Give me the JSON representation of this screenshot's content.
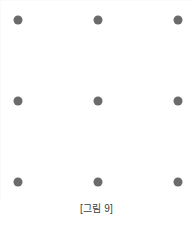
{
  "figure": {
    "caption": "[그림 9]",
    "background_color": "#ffffff",
    "dot_color": "#6b6b6b",
    "caption_color": "#3d3d3d",
    "grid": {
      "rows": 3,
      "columns": 3,
      "dot_diameter_px": 9,
      "column_x": [
        18,
        98,
        178
      ],
      "row_y": [
        20,
        101,
        182
      ],
      "dots": [
        {
          "id": "dot-1",
          "row": 1,
          "col": 1,
          "x": 18,
          "y": 20
        },
        {
          "id": "dot-2",
          "row": 1,
          "col": 2,
          "x": 98,
          "y": 20
        },
        {
          "id": "dot-3",
          "row": 1,
          "col": 3,
          "x": 178,
          "y": 20
        },
        {
          "id": "dot-4",
          "row": 2,
          "col": 1,
          "x": 18,
          "y": 101
        },
        {
          "id": "dot-5",
          "row": 2,
          "col": 2,
          "x": 98,
          "y": 101
        },
        {
          "id": "dot-6",
          "row": 2,
          "col": 3,
          "x": 178,
          "y": 101
        },
        {
          "id": "dot-7",
          "row": 3,
          "col": 1,
          "x": 18,
          "y": 182
        },
        {
          "id": "dot-8",
          "row": 3,
          "col": 2,
          "x": 98,
          "y": 182
        },
        {
          "id": "dot-9",
          "row": 3,
          "col": 3,
          "x": 178,
          "y": 182
        }
      ]
    }
  }
}
